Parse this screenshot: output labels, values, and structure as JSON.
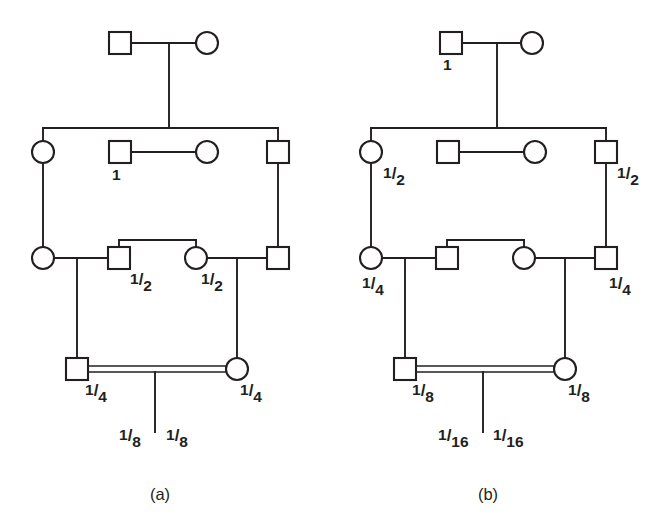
{
  "figure": {
    "background_color": "#ffffff",
    "line_color": "#231f20",
    "symbol_fill": "#ffffff",
    "panels": [
      {
        "id": "a",
        "caption": "(a)",
        "symbols": [
          {
            "name": "gen1-male",
            "shape": "square",
            "label": ""
          },
          {
            "name": "gen1-female",
            "shape": "circle",
            "label": ""
          },
          {
            "name": "gen2-left-female",
            "shape": "circle",
            "label": ""
          },
          {
            "name": "gen2-mid-male",
            "shape": "square",
            "label": "1"
          },
          {
            "name": "gen2-mid-female",
            "shape": "circle",
            "label": ""
          },
          {
            "name": "gen2-right-male",
            "shape": "square",
            "label": ""
          },
          {
            "name": "gen3-left-female",
            "shape": "circle",
            "label": ""
          },
          {
            "name": "gen3-midleft-male",
            "shape": "square",
            "label": "1/2"
          },
          {
            "name": "gen3-midright-female",
            "shape": "circle",
            "label": "1/2"
          },
          {
            "name": "gen3-right-male",
            "shape": "square",
            "label": ""
          },
          {
            "name": "gen4-male",
            "shape": "square",
            "label": "1/4"
          },
          {
            "name": "gen4-female",
            "shape": "circle",
            "label": "1/4"
          }
        ],
        "labels": {
          "gen2_mid_male": {
            "num": "1",
            "plain": true
          },
          "gen3_midleft_male": {
            "num": "1",
            "den": "2"
          },
          "gen3_midright_female": {
            "num": "1",
            "den": "2"
          },
          "gen4_male": {
            "num": "1",
            "den": "4"
          },
          "gen4_female": {
            "num": "1",
            "den": "4"
          },
          "offspring_left": {
            "num": "1",
            "den": "8"
          },
          "offspring_right": {
            "num": "1",
            "den": "8"
          }
        }
      },
      {
        "id": "b",
        "caption": "(b)",
        "symbols": [
          {
            "name": "gen1-male",
            "shape": "square",
            "label": "1"
          },
          {
            "name": "gen1-female",
            "shape": "circle",
            "label": ""
          },
          {
            "name": "gen2-left-female",
            "shape": "circle",
            "label": "1/2"
          },
          {
            "name": "gen2-mid-male",
            "shape": "square",
            "label": ""
          },
          {
            "name": "gen2-mid-female",
            "shape": "circle",
            "label": ""
          },
          {
            "name": "gen2-right-male",
            "shape": "square",
            "label": "1/2"
          },
          {
            "name": "gen3-left-female",
            "shape": "circle",
            "label": "1/4"
          },
          {
            "name": "gen3-midleft-male",
            "shape": "square",
            "label": ""
          },
          {
            "name": "gen3-midright-female",
            "shape": "circle",
            "label": ""
          },
          {
            "name": "gen3-right-male",
            "shape": "square",
            "label": "1/4"
          },
          {
            "name": "gen4-male",
            "shape": "square",
            "label": "1/8"
          },
          {
            "name": "gen4-female",
            "shape": "circle",
            "label": "1/8"
          }
        ],
        "labels": {
          "gen1_male": {
            "num": "1",
            "plain": true
          },
          "gen2_left_female": {
            "num": "1",
            "den": "2"
          },
          "gen2_right_male": {
            "num": "1",
            "den": "2"
          },
          "gen3_left_female": {
            "num": "1",
            "den": "4"
          },
          "gen3_right_male": {
            "num": "1",
            "den": "4"
          },
          "gen4_male": {
            "num": "1",
            "den": "8"
          },
          "gen4_female": {
            "num": "1",
            "den": "8"
          },
          "offspring_left": {
            "num": "1",
            "den": "16"
          },
          "offspring_right": {
            "num": "1",
            "den": "16"
          }
        }
      }
    ]
  }
}
